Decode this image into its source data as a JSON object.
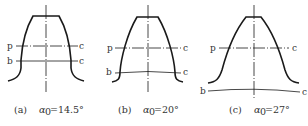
{
  "figure": {
    "type": "gear tooth profile comparison",
    "line_color": "#1a1a1a",
    "panels": [
      {
        "id": "a",
        "caption_prefix": "(a)",
        "symbol": "α",
        "subscript": "0",
        "value": "=14.5°",
        "pressure_angle_deg": 14.5,
        "labels": {
          "p": "p",
          "b": "b",
          "c1": "c",
          "c2": "c"
        }
      },
      {
        "id": "b",
        "caption_prefix": "(b)",
        "symbol": "α",
        "subscript": "0",
        "value": "=20°",
        "pressure_angle_deg": 20,
        "labels": {
          "p": "p",
          "b": "b",
          "c1": "c",
          "c2": "c"
        }
      },
      {
        "id": "c",
        "caption_prefix": "(c)",
        "symbol": "α",
        "subscript": "0",
        "value": "=27°",
        "pressure_angle_deg": 27,
        "labels": {
          "p": "p",
          "b": "b",
          "c1": "c",
          "c2": "c"
        }
      }
    ]
  }
}
